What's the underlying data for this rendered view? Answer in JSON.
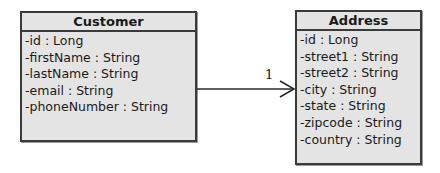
{
  "diagram": {
    "type": "uml-class-diagram",
    "classes": [
      {
        "name": "Customer",
        "attributes": [
          "-id : Long",
          "-firstName : String",
          "-lastName : String",
          "-email : String",
          "-phoneNumber : String"
        ]
      },
      {
        "name": "Address",
        "attributes": [
          "-id : Long",
          "-street1 : String",
          "-street2 : String",
          "-city : String",
          "-state : String",
          "-zipcode : String",
          "-country : String"
        ]
      }
    ],
    "associations": [
      {
        "from": "Customer",
        "to": "Address",
        "navigable": "to",
        "multiplicity_to": "1"
      }
    ]
  },
  "colors": {
    "box_fill": "#e4e4e4",
    "border": "#3a3a3a",
    "line": "#2a2a2a"
  }
}
